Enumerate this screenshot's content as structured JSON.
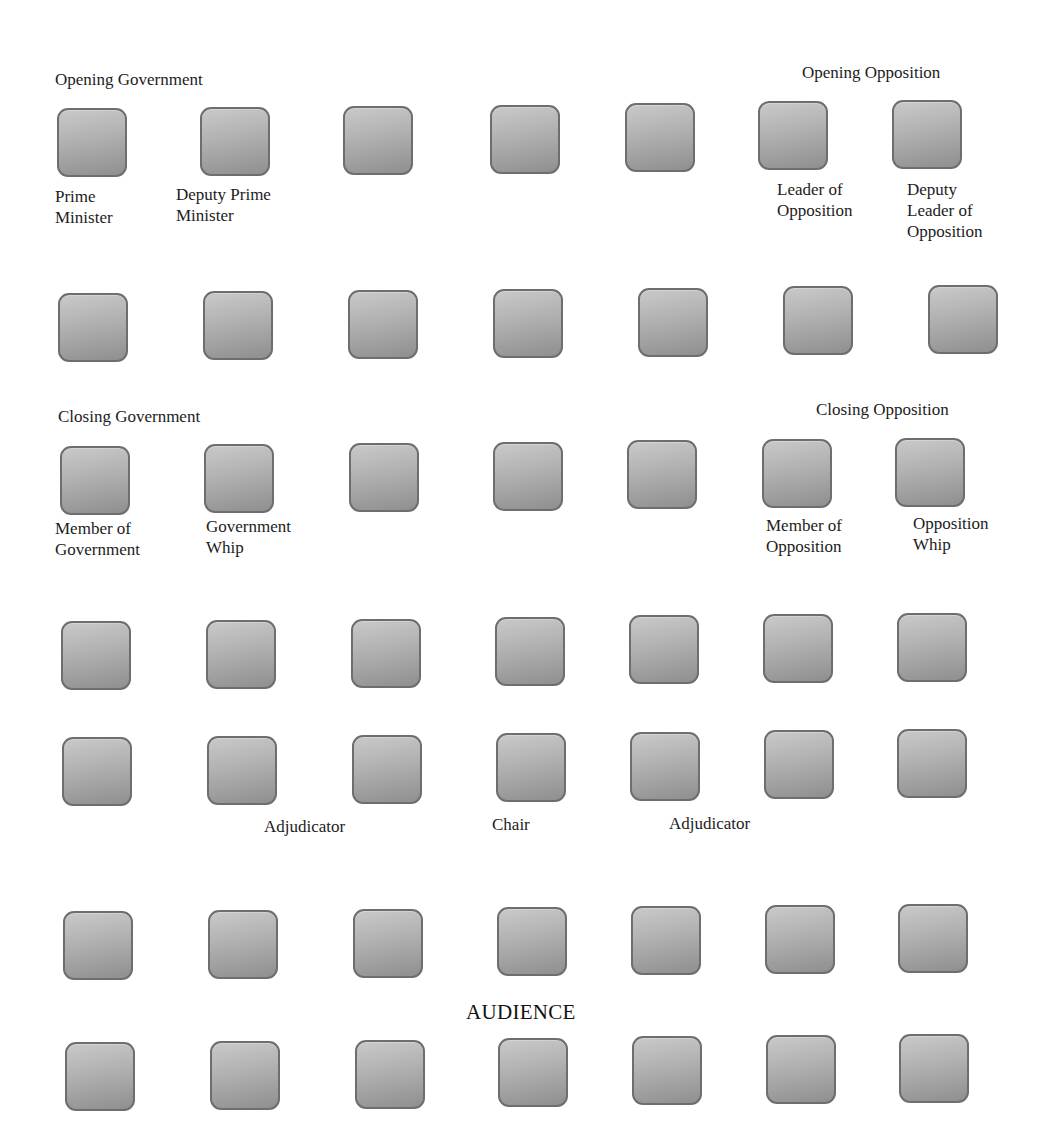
{
  "diagram": {
    "type": "seating-layout",
    "rows": 7,
    "columns": 7,
    "seat_color": "#a8a8a8",
    "seat_border_color": "#6e6e6e"
  },
  "headings": [
    {
      "id": "opening-government",
      "text": "Opening Government",
      "x": 55,
      "y": 70
    },
    {
      "id": "opening-opposition",
      "text": "Opening Opposition",
      "x": 802,
      "y": 63
    },
    {
      "id": "closing-government",
      "text": "Closing Government",
      "x": 58,
      "y": 407
    },
    {
      "id": "closing-opposition",
      "text": "Closing Opposition",
      "x": 816,
      "y": 400
    }
  ],
  "roles": [
    {
      "id": "prime-minister",
      "text": "Prime\nMinister",
      "x": 55,
      "y": 186
    },
    {
      "id": "deputy-prime-minister",
      "text": "Deputy Prime\nMinister",
      "x": 176,
      "y": 184
    },
    {
      "id": "leader-of-opposition",
      "text": "Leader of\nOpposition",
      "x": 777,
      "y": 179
    },
    {
      "id": "deputy-leader-of-opposition",
      "text": "Deputy\nLeader of\nOpposition",
      "x": 907,
      "y": 179
    },
    {
      "id": "member-of-government",
      "text": "Member of\nGovernment",
      "x": 55,
      "y": 518
    },
    {
      "id": "government-whip",
      "text": "Government\nWhip",
      "x": 206,
      "y": 516
    },
    {
      "id": "member-of-opposition",
      "text": "Member of\nOpposition",
      "x": 766,
      "y": 515
    },
    {
      "id": "opposition-whip",
      "text": "Opposition\nWhip",
      "x": 913,
      "y": 513
    },
    {
      "id": "adjudicator-left",
      "text": "Adjudicator",
      "x": 264,
      "y": 816
    },
    {
      "id": "chair",
      "text": "Chair",
      "x": 492,
      "y": 814
    },
    {
      "id": "adjudicator-right",
      "text": "Adjudicator",
      "x": 669,
      "y": 813
    }
  ],
  "audience_label": {
    "text": "AUDIENCE",
    "x": 466,
    "y": 1000
  },
  "seats": [
    {
      "row": 1,
      "col": 1,
      "x": 57,
      "y": 108
    },
    {
      "row": 1,
      "col": 2,
      "x": 200,
      "y": 107
    },
    {
      "row": 1,
      "col": 3,
      "x": 343,
      "y": 106
    },
    {
      "row": 1,
      "col": 4,
      "x": 490,
      "y": 105
    },
    {
      "row": 1,
      "col": 5,
      "x": 625,
      "y": 103
    },
    {
      "row": 1,
      "col": 6,
      "x": 758,
      "y": 101
    },
    {
      "row": 1,
      "col": 7,
      "x": 892,
      "y": 100
    },
    {
      "row": 2,
      "col": 1,
      "x": 58,
      "y": 293
    },
    {
      "row": 2,
      "col": 2,
      "x": 203,
      "y": 291
    },
    {
      "row": 2,
      "col": 3,
      "x": 348,
      "y": 290
    },
    {
      "row": 2,
      "col": 4,
      "x": 493,
      "y": 289
    },
    {
      "row": 2,
      "col": 5,
      "x": 638,
      "y": 288
    },
    {
      "row": 2,
      "col": 6,
      "x": 783,
      "y": 286
    },
    {
      "row": 2,
      "col": 7,
      "x": 928,
      "y": 285
    },
    {
      "row": 3,
      "col": 1,
      "x": 60,
      "y": 446
    },
    {
      "row": 3,
      "col": 2,
      "x": 204,
      "y": 444
    },
    {
      "row": 3,
      "col": 3,
      "x": 349,
      "y": 443
    },
    {
      "row": 3,
      "col": 4,
      "x": 493,
      "y": 442
    },
    {
      "row": 3,
      "col": 5,
      "x": 627,
      "y": 440
    },
    {
      "row": 3,
      "col": 6,
      "x": 762,
      "y": 439
    },
    {
      "row": 3,
      "col": 7,
      "x": 895,
      "y": 438
    },
    {
      "row": 4,
      "col": 1,
      "x": 61,
      "y": 621
    },
    {
      "row": 4,
      "col": 2,
      "x": 206,
      "y": 620
    },
    {
      "row": 4,
      "col": 3,
      "x": 351,
      "y": 619
    },
    {
      "row": 4,
      "col": 4,
      "x": 495,
      "y": 617
    },
    {
      "row": 4,
      "col": 5,
      "x": 629,
      "y": 615
    },
    {
      "row": 4,
      "col": 6,
      "x": 763,
      "y": 614
    },
    {
      "row": 4,
      "col": 7,
      "x": 897,
      "y": 613
    },
    {
      "row": 5,
      "col": 1,
      "x": 62,
      "y": 737
    },
    {
      "row": 5,
      "col": 2,
      "x": 207,
      "y": 736
    },
    {
      "row": 5,
      "col": 3,
      "x": 352,
      "y": 735
    },
    {
      "row": 5,
      "col": 4,
      "x": 496,
      "y": 733
    },
    {
      "row": 5,
      "col": 5,
      "x": 630,
      "y": 732
    },
    {
      "row": 5,
      "col": 6,
      "x": 764,
      "y": 730
    },
    {
      "row": 5,
      "col": 7,
      "x": 897,
      "y": 729
    },
    {
      "row": 6,
      "col": 1,
      "x": 63,
      "y": 911
    },
    {
      "row": 6,
      "col": 2,
      "x": 208,
      "y": 910
    },
    {
      "row": 6,
      "col": 3,
      "x": 353,
      "y": 909
    },
    {
      "row": 6,
      "col": 4,
      "x": 497,
      "y": 907
    },
    {
      "row": 6,
      "col": 5,
      "x": 631,
      "y": 906
    },
    {
      "row": 6,
      "col": 6,
      "x": 765,
      "y": 905
    },
    {
      "row": 6,
      "col": 7,
      "x": 898,
      "y": 904
    },
    {
      "row": 7,
      "col": 1,
      "x": 65,
      "y": 1042
    },
    {
      "row": 7,
      "col": 2,
      "x": 210,
      "y": 1041
    },
    {
      "row": 7,
      "col": 3,
      "x": 355,
      "y": 1040
    },
    {
      "row": 7,
      "col": 4,
      "x": 498,
      "y": 1038
    },
    {
      "row": 7,
      "col": 5,
      "x": 632,
      "y": 1036
    },
    {
      "row": 7,
      "col": 6,
      "x": 766,
      "y": 1035
    },
    {
      "row": 7,
      "col": 7,
      "x": 899,
      "y": 1034
    }
  ]
}
